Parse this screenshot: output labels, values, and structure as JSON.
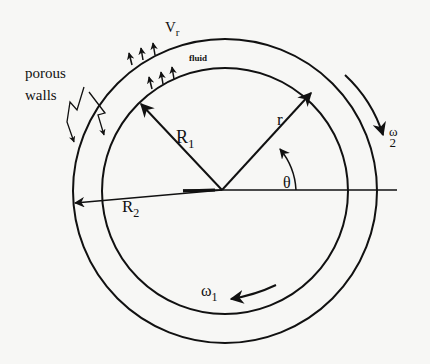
{
  "diagram": {
    "colors": {
      "stroke": "#111111",
      "background": "#f7f7f5"
    },
    "labels": {
      "porous_walls_line1": "porous",
      "porous_walls_line2": "walls",
      "radial_velocity": "V",
      "radial_velocity_sub": "r",
      "fluid": "fluid",
      "inner_radius": "R",
      "inner_radius_sub": "1",
      "outer_radius": "R",
      "outer_radius_sub": "2",
      "radius": "r",
      "angle": "θ",
      "omega_outer": "ω",
      "omega_outer_sub": "2",
      "omega_inner": "ω",
      "omega_inner_sub": "1"
    },
    "geometry": {
      "center": [
        222,
        190
      ],
      "inner_circle_radius": 122,
      "outer_circle_radius": 151
    }
  }
}
